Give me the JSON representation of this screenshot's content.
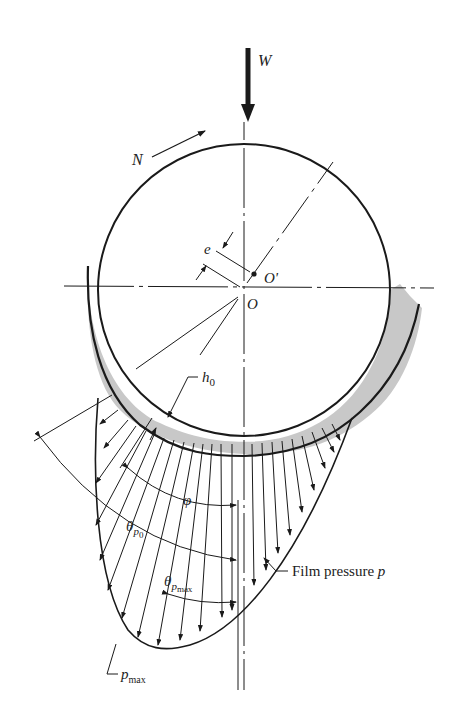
{
  "colors": {
    "ink": "#1a1a1a",
    "film_fill": "#c8c8c8",
    "background": "#ffffff"
  },
  "labels": {
    "load": "W",
    "rotation": "N",
    "eccentricity": "e",
    "journal_center": "O'",
    "bearing_center": "O",
    "min_film_thickness": "h",
    "min_film_thickness_sub": "0",
    "angle_phi": "φ",
    "angle_theta": "θ",
    "theta_p0_sub": "p",
    "theta_p0_subsub": "0",
    "theta_pmax_sub": "p",
    "theta_pmax_subsub": "max",
    "film_pressure": "Film pressure ",
    "film_pressure_symbol": "p",
    "pmax": "p",
    "pmax_sub": "max"
  }
}
